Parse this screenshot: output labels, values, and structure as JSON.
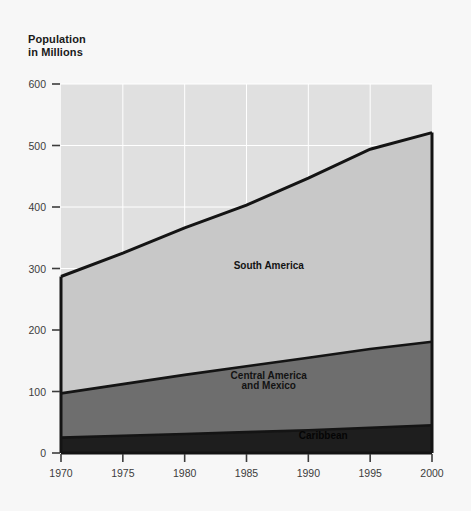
{
  "chart_data": {
    "type": "area",
    "stacked": true,
    "title": "Population\nin Millions",
    "xlabel": "",
    "ylabel": "Population in Millions",
    "x": [
      1970,
      1975,
      1980,
      1985,
      1990,
      1995,
      2000
    ],
    "xlim": [
      1970,
      2000
    ],
    "ylim": [
      0,
      600
    ],
    "xticks": [
      1970,
      1975,
      1980,
      1985,
      1990,
      1995,
      2000
    ],
    "yticks": [
      0,
      100,
      200,
      300,
      400,
      500,
      600
    ],
    "xtick_labels": [
      "1970",
      "1975",
      "1980",
      "1985",
      "1990",
      "1995",
      "2000"
    ],
    "ytick_labels": [
      "0",
      "100",
      "200",
      "300",
      "400",
      "500",
      "600"
    ],
    "grid": true,
    "grid_color": "#ffffff",
    "legend": "inline-labels",
    "series": [
      {
        "name": "Caribbean",
        "values": [
          25,
          28,
          31,
          34,
          37,
          41,
          45
        ],
        "color": "#1e1e1e",
        "label_color": "#050505"
      },
      {
        "name": "Central America\nand Mexico",
        "values": [
          72,
          84,
          96,
          107,
          118,
          128,
          136
        ],
        "color": "#6e6e6e",
        "label_color": "#131313"
      },
      {
        "name": "South America",
        "values": [
          190,
          213,
          239,
          262,
          292,
          325,
          340
        ],
        "color": "#c8c8c8",
        "label_color": "#131313"
      }
    ],
    "totals": [
      287,
      325,
      366,
      403,
      447,
      494,
      521
    ],
    "annotations": [
      {
        "text": "South America",
        "x": 1986.8,
        "y": 300
      },
      {
        "text": "Central America",
        "x": 1986.8,
        "y": 120
      },
      {
        "text": "and Mexico",
        "x": 1986.8,
        "y": 104
      },
      {
        "text": "Caribbean",
        "x": 1991.2,
        "y": 22
      }
    ]
  },
  "colors": {
    "background": "#f7f7f7",
    "plot_empty": "#e0e0e0",
    "grid": "#ffffff",
    "axis_line": "#141414",
    "tick": "#3c3c3c",
    "title_text": "#1a1a1a"
  }
}
